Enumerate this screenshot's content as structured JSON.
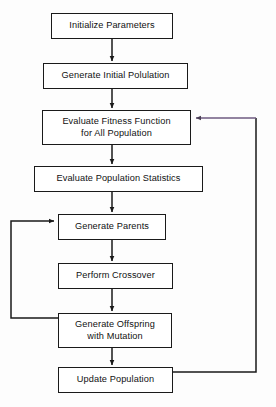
{
  "diagram": {
    "type": "flowchart",
    "background_color": "#fdfdfd",
    "line_color": "#1a1a1a",
    "feedback_line_color": "#6e5a80",
    "nodes": [
      {
        "id": "initialize-parameters",
        "label": "Initialize Parameters",
        "x": 51,
        "y": 13,
        "w": 122,
        "h": 26
      },
      {
        "id": "generate-initial-population",
        "label": "Generate Initial Polulation",
        "x": 43,
        "y": 63,
        "w": 145,
        "h": 26
      },
      {
        "id": "evaluate-fitness-function",
        "label": "Evaluate Fitness Function\nfor All Population",
        "x": 42,
        "y": 110,
        "w": 149,
        "h": 35
      },
      {
        "id": "evaluate-population-statistics",
        "label": "Evaluate Population Statistics",
        "x": 34,
        "y": 166,
        "w": 169,
        "h": 26
      },
      {
        "id": "generate-parents",
        "label": "Generate Parents",
        "x": 58,
        "y": 214,
        "w": 108,
        "h": 26
      },
      {
        "id": "perform-crossover",
        "label": "Perform Crossover",
        "x": 58,
        "y": 263,
        "w": 115,
        "h": 26
      },
      {
        "id": "generate-offspring-with-mutation",
        "label": "Generate Offspring\nwith Mutation",
        "x": 58,
        "y": 313,
        "w": 114,
        "h": 35
      },
      {
        "id": "update-population",
        "label": "Update Population",
        "x": 58,
        "y": 367,
        "w": 115,
        "h": 26
      }
    ],
    "edges": [
      {
        "id": "edge-init-to-genpop",
        "from": "initialize-parameters",
        "to": "generate-initial-population",
        "kind": "straight-down"
      },
      {
        "id": "edge-genpop-to-fitness",
        "from": "generate-initial-population",
        "to": "evaluate-fitness-function",
        "kind": "straight-down"
      },
      {
        "id": "edge-fitness-to-stats",
        "from": "evaluate-fitness-function",
        "to": "evaluate-population-statistics",
        "kind": "straight-down"
      },
      {
        "id": "edge-stats-to-parents",
        "from": "evaluate-population-statistics",
        "to": "generate-parents",
        "kind": "straight-down"
      },
      {
        "id": "edge-parents-to-crossover",
        "from": "generate-parents",
        "to": "perform-crossover",
        "kind": "straight-down"
      },
      {
        "id": "edge-crossover-to-offspring",
        "from": "perform-crossover",
        "to": "generate-offspring-with-mutation",
        "kind": "straight-down"
      },
      {
        "id": "edge-offspring-to-update",
        "from": "generate-offspring-with-mutation",
        "to": "update-population",
        "kind": "straight-down"
      },
      {
        "id": "edge-offspring-loop-to-parents",
        "from": "generate-offspring-with-mutation",
        "to": "generate-parents",
        "kind": "left-feedback-loop"
      },
      {
        "id": "edge-update-loop-to-fitness",
        "from": "update-population",
        "to": "evaluate-fitness-function",
        "kind": "right-feedback-loop"
      }
    ]
  }
}
